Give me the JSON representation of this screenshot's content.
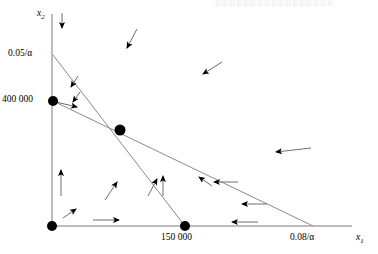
{
  "figure": {
    "background": "#ffffff",
    "width": 378,
    "height": 254
  },
  "axes": {
    "x_axis": {
      "label": "x",
      "subscript": "1",
      "label_full": "x₁",
      "color": "#7a7a7a",
      "start_px": [
        52,
        226
      ],
      "end_px": [
        352,
        226
      ]
    },
    "y_axis": {
      "label": "x",
      "subscript": "2",
      "label_full": "x₂",
      "color": "#7a7a7a",
      "start_px": [
        52,
        226
      ],
      "end_px": [
        52,
        14
      ]
    }
  },
  "tick_labels": {
    "y_top": "0.05/α",
    "y_mid": "400 000",
    "x_mid": "150 000",
    "x_right": "0.08/α"
  },
  "vertices": [
    {
      "name": "origin",
      "label": "",
      "x_px": 52,
      "y_px": 226,
      "radius": 5
    },
    {
      "name": "y-intercept-400000",
      "label": "400 000",
      "x_px": 53,
      "y_px": 101,
      "radius": 5
    },
    {
      "name": "intersection",
      "label": "",
      "x_px": 120,
      "y_px": 130,
      "radius": 5.5
    },
    {
      "name": "x-intercept-150000",
      "label": "150 000",
      "x_px": 185,
      "y_px": 226,
      "radius": 5
    }
  ],
  "constraint_lines": [
    {
      "name": "line-0.05-alpha",
      "from_px": [
        53,
        55
      ],
      "to_px": [
        185,
        226
      ],
      "note": "from 0.05/α on x2-axis to 150 000 on x1-axis"
    },
    {
      "name": "line-0.08-alpha",
      "from_px": [
        53,
        101
      ],
      "to_px": [
        313,
        226
      ],
      "note": "from 400 000 on x2-axis to 0.08/α on x1-axis"
    }
  ],
  "arrows": [
    {
      "name": "arrow-top-axis-down",
      "x1": 62,
      "y1": 13,
      "x2": 62,
      "y2": 30
    },
    {
      "name": "arrow-upper-down-left",
      "x1": 137,
      "y1": 29,
      "x2": 126,
      "y2": 50
    },
    {
      "name": "arrow-upper-right-down-left",
      "x1": 222,
      "y1": 62,
      "x2": 201,
      "y2": 75
    },
    {
      "name": "arrow-inner-a-down-left",
      "x1": 78,
      "y1": 76,
      "x2": 70,
      "y2": 88
    },
    {
      "name": "arrow-inner-b-down-left",
      "x1": 80,
      "y1": 92,
      "x2": 72,
      "y2": 103
    },
    {
      "name": "arrow-from-400k-right",
      "x1": 55,
      "y1": 102,
      "x2": 78,
      "y2": 107
    },
    {
      "name": "arrow-right-mid-left",
      "x1": 311,
      "y1": 148,
      "x2": 274,
      "y2": 152
    },
    {
      "name": "arrow-y-axis-up",
      "x1": 61,
      "y1": 196,
      "x2": 61,
      "y2": 168
    },
    {
      "name": "arrow-inner-up-left",
      "x1": 105,
      "y1": 200,
      "x2": 118,
      "y2": 180
    },
    {
      "name": "arrow-inner-up-right",
      "x1": 148,
      "y1": 196,
      "x2": 158,
      "y2": 177
    },
    {
      "name": "arrow-mid-up",
      "x1": 163,
      "y1": 196,
      "x2": 163,
      "y2": 174
    },
    {
      "name": "arrow-diagonal-up-left",
      "x1": 212,
      "y1": 186,
      "x2": 197,
      "y2": 176
    },
    {
      "name": "arrow-cross-line-a-left",
      "x1": 238,
      "y1": 182,
      "x2": 212,
      "y2": 182
    },
    {
      "name": "arrow-cross-line-b-left",
      "x1": 267,
      "y1": 204,
      "x2": 240,
      "y2": 204
    },
    {
      "name": "arrow-bottom-left-up-right",
      "x1": 63,
      "y1": 218,
      "x2": 77,
      "y2": 208
    },
    {
      "name": "arrow-bottom-axis-right",
      "x1": 93,
      "y1": 220,
      "x2": 121,
      "y2": 220
    },
    {
      "name": "arrow-bottom-right-left",
      "x1": 258,
      "y1": 222,
      "x2": 230,
      "y2": 222
    }
  ],
  "colors": {
    "line": "#8a8a8a",
    "axis": "#7a7a7a",
    "vertex": "#000000",
    "arrow": "#6e6e6e",
    "text": "#000000",
    "background": "#ffffff"
  }
}
